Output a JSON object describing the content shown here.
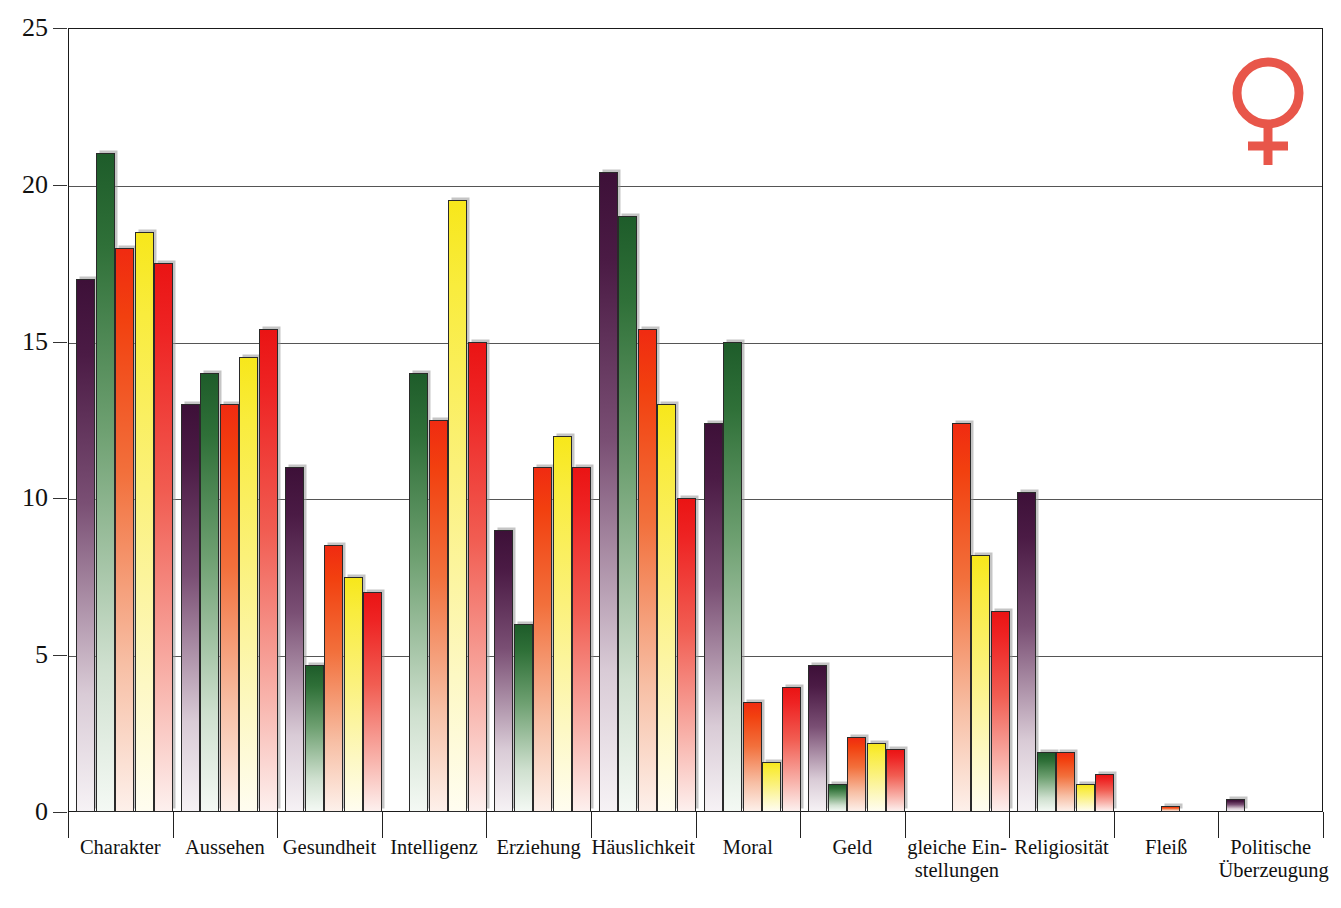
{
  "chart_data": {
    "type": "bar",
    "title": "",
    "subtitle": "",
    "xlabel": "",
    "ylabel": "",
    "ylim": [
      0,
      25
    ],
    "yticks": [
      0,
      5,
      10,
      15,
      20,
      25
    ],
    "grid": true,
    "legend": "none",
    "orientation": "vertical",
    "grouped": true,
    "bars_per_group": 5,
    "categories": [
      "Charakter",
      "Aussehen",
      "Gesundheit",
      "Intelligenz",
      "Erziehung",
      "Häuslichkeit",
      "Moral",
      "Geld",
      "gleiche Ein-\nstellungen",
      "Religiosität",
      "Fleiß",
      "Politische\nÜberzeugung"
    ],
    "series": [
      {
        "name": "series-1",
        "color": "#4b1b45",
        "values": [
          17.0,
          13.0,
          11.0,
          null,
          9.0,
          20.4,
          12.4,
          4.7,
          null,
          10.2,
          null,
          0.4
        ]
      },
      {
        "name": "series-2",
        "color": "#2f7038",
        "values": [
          21.0,
          14.0,
          4.7,
          14.0,
          6.0,
          19.0,
          15.0,
          0.9,
          null,
          1.9,
          null,
          null
        ]
      },
      {
        "name": "series-3",
        "color": "#f2400f",
        "values": [
          18.0,
          13.0,
          8.5,
          12.5,
          11.0,
          15.4,
          3.5,
          2.4,
          12.4,
          1.9,
          0.2,
          null
        ]
      },
      {
        "name": "series-4",
        "color": "#f9ec3d",
        "values": [
          18.5,
          14.5,
          7.5,
          19.5,
          12.0,
          13.0,
          1.6,
          2.2,
          8.2,
          0.9,
          null,
          null
        ]
      },
      {
        "name": "series-5",
        "color": "#ee2323",
        "values": [
          17.5,
          15.4,
          7.0,
          15.0,
          11.0,
          10.0,
          4.0,
          2.0,
          6.4,
          1.2,
          null,
          null
        ]
      }
    ]
  },
  "icons": {
    "venus": {
      "name": "venus-symbol",
      "color": "#e8564a"
    }
  },
  "axis": {
    "y_tick_labels": [
      "0",
      "5",
      "10",
      "15",
      "20",
      "25"
    ]
  }
}
